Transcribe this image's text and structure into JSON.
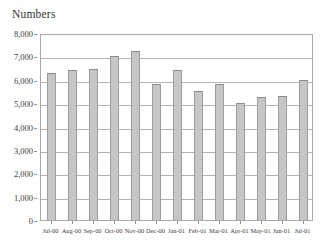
{
  "chart_data": {
    "type": "bar",
    "title": "Numbers",
    "xlabel": "",
    "ylabel": "",
    "categories": [
      "Jul-00",
      "Aug-00",
      "Sep-00",
      "Oct-00",
      "Nov-00",
      "Dec-00",
      "Jan-01",
      "Feb-01",
      "Mar-01",
      "Apr-01",
      "May-01",
      "Jun-01",
      "Jul-01"
    ],
    "values": [
      6300,
      6430,
      6460,
      7000,
      7250,
      5830,
      6400,
      5530,
      5830,
      5020,
      5270,
      5290,
      6000
    ],
    "ylim": [
      0,
      8000
    ],
    "y_ticks": [
      0,
      1000,
      2000,
      3000,
      4000,
      5000,
      6000,
      7000,
      8000
    ],
    "y_tick_labels": [
      "0",
      "1,000",
      "2,000",
      "3,000",
      "4,000",
      "5,000",
      "6,000",
      "7,000",
      "8,000"
    ],
    "grid": true,
    "legend": "none",
    "bar_color": "#c6c6c6",
    "bar_edge_color": "#9d9d9d",
    "grid_color": "#b4b4b4",
    "frame_color": "#a8a8a8",
    "background_color": "#ffffff",
    "text_color": "#3d3d3d"
  }
}
